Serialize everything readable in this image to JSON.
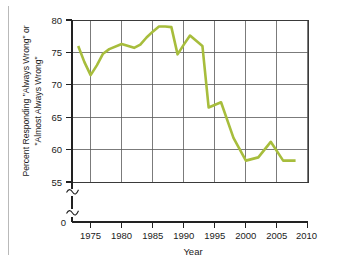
{
  "figure": {
    "background_color": "#ffffff",
    "line_color": "#a7bd3c",
    "grid_color": "#5a5a5a",
    "axis_color": "#222222"
  },
  "chart_data": {
    "type": "line",
    "title": "",
    "subtitle": "",
    "xlabel": "Year",
    "ylabel": "Percent Responding \"Always Wrong\" or \"Almost Always Wrong\"",
    "ylabel_line1": "Percent Responding \"Always Wrong\" or",
    "ylabel_line2": "\"Almost Always Wrong\"",
    "xlim": [
      1972,
      2010
    ],
    "ylim": [
      55,
      80
    ],
    "yaxis_broken": true,
    "yaxis_break_labels": [
      "0"
    ],
    "grid": true,
    "grid_axes": "both",
    "legend": "none",
    "xticks": [
      1975,
      1980,
      1985,
      1990,
      1995,
      2000,
      2005,
      2010
    ],
    "xticklabels": [
      "1975",
      "1980",
      "1985",
      "1990",
      "1995",
      "2000",
      "2005",
      "2010"
    ],
    "yticks": [
      55,
      60,
      65,
      70,
      75,
      80
    ],
    "yticklabels": [
      "55",
      "60",
      "65",
      "70",
      "75",
      "80"
    ],
    "zero_tick_label": "0",
    "x": [
      1973,
      1974,
      1975,
      1976,
      1977,
      1978,
      1980,
      1982,
      1983,
      1984,
      1985,
      1986,
      1987,
      1988,
      1989,
      1990,
      1991,
      1993,
      1994,
      1996,
      1998,
      2000,
      2002,
      2004,
      2006,
      2008
    ],
    "series": [
      {
        "name": "Percent Responding Always Wrong or Almost Always Wrong",
        "color": "#a7bd3c",
        "values": [
          76.0,
          73.5,
          71.5,
          73.0,
          74.8,
          75.5,
          76.3,
          75.7,
          76.2,
          77.3,
          78.2,
          79.0,
          79.0,
          78.9,
          74.7,
          76.2,
          77.6,
          76.0,
          66.5,
          67.3,
          61.8,
          58.3,
          58.8,
          61.2,
          58.3,
          58.3
        ]
      }
    ]
  },
  "axis_breaks": {
    "symbol": "squiggle",
    "count": 2,
    "description": "two break marks on the vertical axis below 55"
  }
}
